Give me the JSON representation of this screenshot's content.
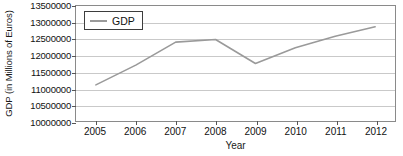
{
  "chart_data": {
    "type": "line",
    "title": "",
    "xlabel": "Year",
    "ylabel": "GDP (in Millions of Euros)",
    "categories": [
      "2005",
      "2006",
      "2007",
      "2008",
      "2009",
      "2010",
      "2011",
      "2012"
    ],
    "x": [
      2005,
      2006,
      2007,
      2008,
      2009,
      2010,
      2011,
      2012
    ],
    "series": [
      {
        "name": "GDP",
        "color": "#9a9a9a",
        "values": [
          11100000,
          11700000,
          12400000,
          12480000,
          11750000,
          12230000,
          12580000,
          12870000
        ]
      }
    ],
    "ylim": [
      10000000,
      13500000
    ],
    "xlim": [
      2005,
      2012
    ],
    "ytick_values": [
      10000000,
      10500000,
      11000000,
      11500000,
      12000000,
      12500000,
      13000000,
      13500000
    ],
    "ytick_labels": [
      "10000000",
      "10500000",
      "11000000",
      "11500000",
      "12000000",
      "12500000",
      "13000000",
      "13500000"
    ],
    "xtick_labels": [
      "2005",
      "2006",
      "2007",
      "2008",
      "2009",
      "2010",
      "2011",
      "2012"
    ],
    "grid": true,
    "grid_axis": "y",
    "grid_color": "#c9c9c9",
    "legend": {
      "position": "top-left",
      "entries": [
        "GDP"
      ]
    },
    "frame_color": "#8a8a8a",
    "background": "#ffffff"
  }
}
